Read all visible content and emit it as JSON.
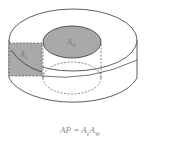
{
  "figure": {
    "labels": {
      "window_area": "A",
      "window_area_sub": "W",
      "core_area": "A",
      "core_area_sub": "e"
    },
    "formula": {
      "lhs": "AP",
      "eq": " = ",
      "t1": "A",
      "t1_sub": "e",
      "t2": "A",
      "t2_sub": "W"
    },
    "colors": {
      "stroke": "#333333",
      "shade": "#a9a9a9",
      "background": "#ffffff",
      "label": "#777777"
    }
  }
}
